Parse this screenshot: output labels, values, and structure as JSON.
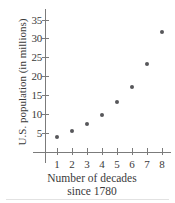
{
  "chart_data": {
    "type": "scatter",
    "title": "",
    "xlabel": "Number of decades since 1780",
    "xlabel_line1": "Number of decades",
    "xlabel_line2": "since 1780",
    "ylabel": "U.S. population (in millions)",
    "x": [
      1,
      2,
      3,
      4,
      5,
      6,
      7,
      8
    ],
    "values": [
      4.0,
      5.4,
      7.3,
      9.9,
      13.1,
      17.2,
      23.4,
      31.7
    ],
    "series": [
      {
        "name": "U.S. population",
        "points": [
          {
            "x": 1,
            "y": 4.0
          },
          {
            "x": 2,
            "y": 5.4
          },
          {
            "x": 3,
            "y": 7.3
          },
          {
            "x": 4,
            "y": 9.9
          },
          {
            "x": 5,
            "y": 13.1
          },
          {
            "x": 6,
            "y": 17.2
          },
          {
            "x": 7,
            "y": 23.4
          },
          {
            "x": 8,
            "y": 31.7
          }
        ]
      }
    ],
    "xticks": [
      1,
      2,
      3,
      4,
      5,
      6,
      7,
      8
    ],
    "xtick_labels": [
      "1",
      "2",
      "3",
      "4",
      "5",
      "6",
      "7",
      "8"
    ],
    "yticks": [
      5,
      10,
      15,
      20,
      25,
      30,
      35
    ],
    "ytick_labels": [
      "5",
      "10",
      "15",
      "20",
      "25",
      "30",
      "35"
    ],
    "xlim": [
      0,
      9
    ],
    "ylim": [
      0,
      37
    ],
    "grid": false,
    "legend": false,
    "marker_color": "#57575a",
    "axis_color": "#7b7b7b",
    "text_color": "#3a3a3a",
    "background": "#ffffff"
  }
}
